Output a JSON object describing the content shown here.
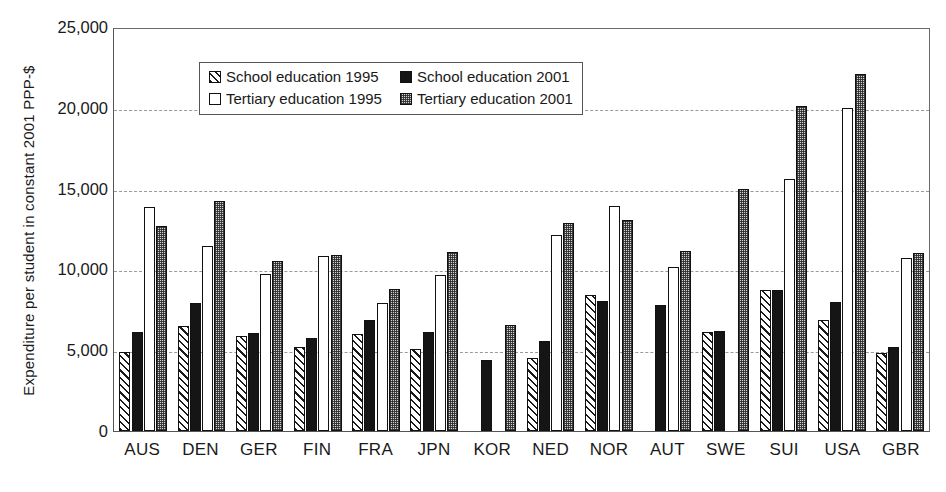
{
  "chart_data": {
    "type": "bar",
    "title": "",
    "xlabel": "",
    "ylabel": "Expenditure per student in constant 2001 PPP-$",
    "ylim": [
      0,
      25000
    ],
    "yticks": [
      "0",
      "5,000",
      "10,000",
      "15,000",
      "20,000",
      "25,000"
    ],
    "ytick_values": [
      0,
      5000,
      10000,
      15000,
      20000,
      25000
    ],
    "grid": "horizontal-dashed",
    "legend_position": "upper-left-inside",
    "categories": [
      "AUS",
      "DEN",
      "GER",
      "FIN",
      "FRA",
      "JPN",
      "KOR",
      "NED",
      "NOR",
      "AUT",
      "SWE",
      "SUI",
      "USA",
      "GBR"
    ],
    "series": [
      {
        "name": "School education 1995",
        "fill": "diagonal-hatch",
        "values": [
          4900,
          6500,
          5900,
          5200,
          6000,
          5100,
          null,
          4500,
          8400,
          null,
          6100,
          8700,
          6900,
          4800
        ]
      },
      {
        "name": "School education 2001",
        "fill": "solid-black",
        "values": [
          6100,
          7900,
          6050,
          5750,
          6850,
          6150,
          4400,
          5600,
          8050,
          7800,
          6200,
          8700,
          8000,
          5200
        ]
      },
      {
        "name": "Tertiary education 1995",
        "fill": "white",
        "values": [
          13850,
          11450,
          9700,
          10800,
          7950,
          9650,
          null,
          12150,
          13900,
          10150,
          null,
          15600,
          20000,
          10700
        ]
      },
      {
        "name": "Tertiary education 2001",
        "fill": "grey-checker",
        "values": [
          12700,
          14250,
          10500,
          10900,
          8800,
          11100,
          6550,
          12850,
          13050,
          11150,
          15000,
          20100,
          22100,
          11000
        ]
      }
    ]
  },
  "legend": {
    "items": [
      {
        "label": "School education 1995"
      },
      {
        "label": "School education 2001"
      },
      {
        "label": "Tertiary education 1995"
      },
      {
        "label": "Tertiary education 2001"
      }
    ]
  }
}
